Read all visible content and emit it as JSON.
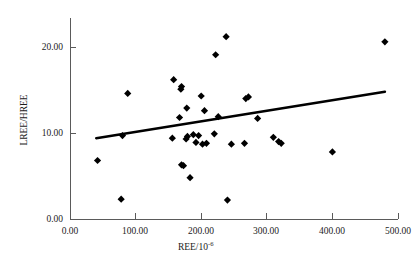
{
  "chart_data": {
    "type": "scatter",
    "title": "",
    "xlabel": "REE/10-6",
    "xlabel_base": "REE/10",
    "xlabel_exponent": "-6",
    "ylabel": "LREE/HREE",
    "xlim": [
      0,
      500
    ],
    "ylim": [
      0,
      25
    ],
    "xticks": [
      0,
      100,
      200,
      300,
      400,
      500
    ],
    "yticks": [
      0,
      10,
      20
    ],
    "xtick_labels": [
      "0.00",
      "100.00",
      "200.00",
      "300.00",
      "400.00",
      "500.00"
    ],
    "ytick_labels": [
      "0.00",
      "10.00",
      "20.00"
    ],
    "grid": false,
    "legend": false,
    "marker": "diamond",
    "marker_color": "#000000",
    "points": [
      {
        "x": 42,
        "y": 6.8
      },
      {
        "x": 78,
        "y": 2.3
      },
      {
        "x": 80,
        "y": 9.7
      },
      {
        "x": 88,
        "y": 14.6
      },
      {
        "x": 156,
        "y": 9.4
      },
      {
        "x": 158,
        "y": 16.2
      },
      {
        "x": 167,
        "y": 11.8
      },
      {
        "x": 169,
        "y": 15.1
      },
      {
        "x": 170,
        "y": 15.4
      },
      {
        "x": 170,
        "y": 6.3
      },
      {
        "x": 173,
        "y": 6.2
      },
      {
        "x": 177,
        "y": 9.3
      },
      {
        "x": 178,
        "y": 12.9
      },
      {
        "x": 179,
        "y": 9.6
      },
      {
        "x": 183,
        "y": 4.8
      },
      {
        "x": 188,
        "y": 9.8
      },
      {
        "x": 192,
        "y": 8.9
      },
      {
        "x": 196,
        "y": 9.7
      },
      {
        "x": 200,
        "y": 14.3
      },
      {
        "x": 202,
        "y": 8.7
      },
      {
        "x": 205,
        "y": 12.6
      },
      {
        "x": 208,
        "y": 8.8
      },
      {
        "x": 220,
        "y": 9.9
      },
      {
        "x": 222,
        "y": 19.1
      },
      {
        "x": 226,
        "y": 11.9
      },
      {
        "x": 238,
        "y": 21.2
      },
      {
        "x": 240,
        "y": 2.2
      },
      {
        "x": 246,
        "y": 8.7
      },
      {
        "x": 266,
        "y": 8.8
      },
      {
        "x": 268,
        "y": 14.0
      },
      {
        "x": 272,
        "y": 14.2
      },
      {
        "x": 286,
        "y": 11.7
      },
      {
        "x": 310,
        "y": 9.5
      },
      {
        "x": 318,
        "y": 9.0
      },
      {
        "x": 322,
        "y": 8.8
      },
      {
        "x": 400,
        "y": 7.8
      },
      {
        "x": 480,
        "y": 20.6
      }
    ],
    "trendline": {
      "type": "linear-fit",
      "x_start": 40,
      "y_start": 9.4,
      "x_end": 480,
      "y_end": 14.8
    }
  },
  "caption": {
    "text": ""
  }
}
